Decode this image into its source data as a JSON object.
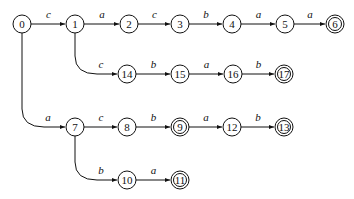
{
  "diagram": {
    "type": "automaton",
    "states": [
      {
        "id": "0",
        "x": 22,
        "y": 24,
        "final": false
      },
      {
        "id": "1",
        "x": 75,
        "y": 24,
        "final": false
      },
      {
        "id": "2",
        "x": 129,
        "y": 24,
        "final": false
      },
      {
        "id": "3",
        "x": 180,
        "y": 24,
        "final": false
      },
      {
        "id": "4",
        "x": 232,
        "y": 24,
        "final": false
      },
      {
        "id": "5",
        "x": 285,
        "y": 24,
        "final": false
      },
      {
        "id": "6",
        "x": 335,
        "y": 24,
        "final": true
      },
      {
        "id": "14",
        "x": 127,
        "y": 74,
        "final": false
      },
      {
        "id": "15",
        "x": 180,
        "y": 74,
        "final": false
      },
      {
        "id": "16",
        "x": 233,
        "y": 74,
        "final": false
      },
      {
        "id": "17",
        "x": 284,
        "y": 74,
        "final": true
      },
      {
        "id": "7",
        "x": 75,
        "y": 127,
        "final": false
      },
      {
        "id": "8",
        "x": 127,
        "y": 127,
        "final": false
      },
      {
        "id": "9",
        "x": 180,
        "y": 127,
        "final": true
      },
      {
        "id": "12",
        "x": 232,
        "y": 127,
        "final": false
      },
      {
        "id": "13",
        "x": 284,
        "y": 127,
        "final": true
      },
      {
        "id": "10",
        "x": 127,
        "y": 180,
        "final": false
      },
      {
        "id": "11",
        "x": 180,
        "y": 180,
        "final": true
      }
    ],
    "transitions": [
      {
        "from": "0",
        "to": "1",
        "label": "c"
      },
      {
        "from": "1",
        "to": "2",
        "label": "a"
      },
      {
        "from": "2",
        "to": "3",
        "label": "c"
      },
      {
        "from": "3",
        "to": "4",
        "label": "b"
      },
      {
        "from": "4",
        "to": "5",
        "label": "a"
      },
      {
        "from": "5",
        "to": "6",
        "label": "a"
      },
      {
        "from": "1",
        "to": "14",
        "label": "c"
      },
      {
        "from": "14",
        "to": "15",
        "label": "b"
      },
      {
        "from": "15",
        "to": "16",
        "label": "a"
      },
      {
        "from": "16",
        "to": "17",
        "label": "b"
      },
      {
        "from": "0",
        "to": "7",
        "label": "a"
      },
      {
        "from": "7",
        "to": "8",
        "label": "c"
      },
      {
        "from": "8",
        "to": "9",
        "label": "b"
      },
      {
        "from": "9",
        "to": "12",
        "label": "a"
      },
      {
        "from": "12",
        "to": "13",
        "label": "b"
      },
      {
        "from": "7",
        "to": "10",
        "label": "b"
      },
      {
        "from": "10",
        "to": "11",
        "label": "a"
      }
    ]
  },
  "colors": {
    "stroke": "#111111",
    "fill": "#ffffff"
  }
}
